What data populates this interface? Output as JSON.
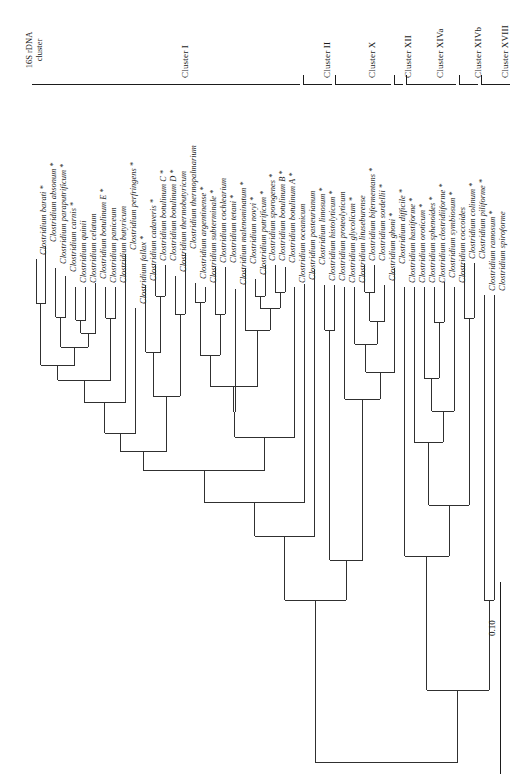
{
  "figure": {
    "type": "phylogenetic-tree",
    "orientation": "rotated-90-left",
    "header": "16S rDNA\ncluster",
    "scale_bar": "0.10"
  },
  "clusters": [
    {
      "id": "cluster-1",
      "label": "Cluster I"
    },
    {
      "id": "cluster-2",
      "label": "Cluster II"
    },
    {
      "id": "cluster-10",
      "label": "Cluster X"
    },
    {
      "id": "cluster-12",
      "label": "Cluster XII"
    },
    {
      "id": "cluster-14a",
      "label": "Cluster XIVa"
    },
    {
      "id": "cluster-14b",
      "label": "Cluster XIVb"
    },
    {
      "id": "cluster-18",
      "label": "Cluster XVIII"
    }
  ],
  "taxa": [
    {
      "name": "Clostridium barati",
      "starred": true
    },
    {
      "name": "Clostridium absonum",
      "starred": true
    },
    {
      "name": "Clostridium paraputrificum",
      "starred": true
    },
    {
      "name": "Clostridium carnis",
      "starred": true
    },
    {
      "name": "Clostridium quinii",
      "starred": false
    },
    {
      "name": "Clostridium celatum",
      "starred": false
    },
    {
      "name": "Clostridium botulinum E",
      "starred": true
    },
    {
      "name": "Clostridium paniceum",
      "starred": false
    },
    {
      "name": "Clostridium butyricum",
      "starred": false
    },
    {
      "name": "Clostridium perfringens",
      "starred": true
    },
    {
      "name": "Clostridium fallax",
      "starred": true
    },
    {
      "name": "Clostridium cadaveris",
      "starred": true
    },
    {
      "name": "Clostridium botulinum C",
      "starred": true
    },
    {
      "name": "Clostridium botulinum D",
      "starred": true
    },
    {
      "name": "Clostridium thermobutyricum",
      "starred": false
    },
    {
      "name": "Clostridium thermopalmarium",
      "starred": false
    },
    {
      "name": "Clostridium argentinense",
      "starred": true
    },
    {
      "name": "Clostridium subterminale",
      "starred": true
    },
    {
      "name": "Clostridium cochlearium",
      "starred": false
    },
    {
      "name": "Clostridium tetani",
      "starred": true
    },
    {
      "name": "Clostridium malenominatum",
      "starred": true
    },
    {
      "name": "Clostridium novyi",
      "starred": true
    },
    {
      "name": "Clostridium putrificum",
      "starred": true
    },
    {
      "name": "Clostridium sporogenes",
      "starred": true
    },
    {
      "name": "Clostridium botulinum B",
      "starred": true
    },
    {
      "name": "Clostridium botulinum A",
      "starred": true
    },
    {
      "name": "Clostridium oceanicum",
      "starred": false
    },
    {
      "name": "Clostridium pasteurianum",
      "starred": false
    },
    {
      "name": "Clostridium limosum",
      "starred": true
    },
    {
      "name": "Clostridium histolyticum",
      "starred": true
    },
    {
      "name": "Clostridium proteolyticum",
      "starred": false
    },
    {
      "name": "Clostridium glycolicum",
      "starred": true
    },
    {
      "name": "Clostridium lituseburense",
      "starred": false
    },
    {
      "name": "Clostridium bifermentans",
      "starred": true
    },
    {
      "name": "Clostridium sordellii",
      "starred": true
    },
    {
      "name": "Clostridium ghoni",
      "starred": true
    },
    {
      "name": "Clostridium difficile",
      "starred": true
    },
    {
      "name": "Clostridium hastiforme",
      "starred": true
    },
    {
      "name": "Clostridium oroticum",
      "starred": true
    },
    {
      "name": "Clostridium sphenoides",
      "starred": true
    },
    {
      "name": "Clostridium clostridiiforme",
      "starred": true
    },
    {
      "name": "Clostridium symbiosum",
      "starred": true
    },
    {
      "name": "Clostridium coccoides",
      "starred": false
    },
    {
      "name": "Clostridium colinum",
      "starred": true
    },
    {
      "name": "Clostridium piliforme",
      "starred": true
    },
    {
      "name": "Clostridium ramosum",
      "starred": true
    },
    {
      "name": "Clostridium spiroforme",
      "starred": false
    }
  ]
}
